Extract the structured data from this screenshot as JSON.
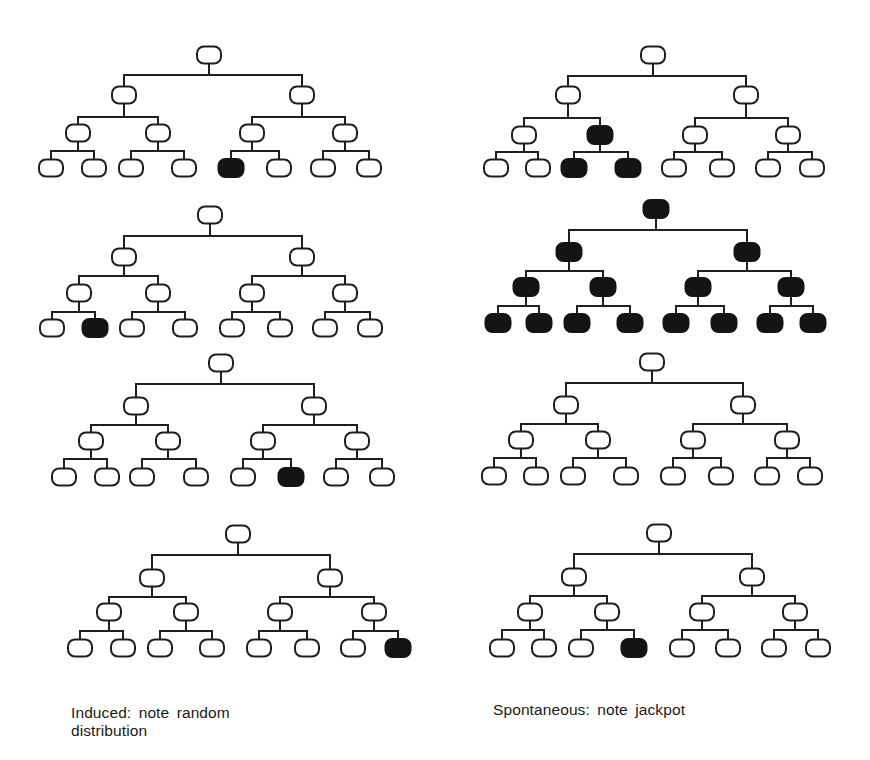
{
  "figure": {
    "colors": {
      "line": "#1e1e1e",
      "node_fill_empty": "#ffffff",
      "node_fill_mutant": "#141414"
    },
    "node": {
      "width": 24,
      "height": 17,
      "rx": 7,
      "stroke": 2
    },
    "captions": {
      "left": "Induced: note random distribution",
      "right": "Spontaneous: note jackpot"
    },
    "columns": [
      {
        "name": "induced",
        "caption_key": "left"
      },
      {
        "name": "spontaneous",
        "caption_key": "right"
      }
    ],
    "trees": [
      {
        "id": "induced-1",
        "column": "induced",
        "root": [
          209,
          55
        ],
        "bar_y": [
          75,
          117,
          151
        ],
        "l1": {
          "x": [
            124,
            302
          ],
          "y": 95
        },
        "l2": {
          "x": [
            78,
            158,
            252,
            345
          ],
          "y": 133
        },
        "leaves": {
          "x": [
            51,
            94,
            131,
            184,
            231,
            279,
            323,
            369
          ],
          "y": 168
        },
        "filled": {
          "root": false,
          "l1": [],
          "l2": [],
          "leaves": [
            4
          ]
        }
      },
      {
        "id": "spontaneous-1",
        "column": "spontaneous",
        "root": [
          653,
          55
        ],
        "bar_y": [
          76,
          118,
          152
        ],
        "l1": {
          "x": [
            568,
            746
          ],
          "y": 95
        },
        "l2": {
          "x": [
            524,
            600,
            695,
            788
          ],
          "y": 135
        },
        "leaves": {
          "x": [
            496,
            538,
            574,
            628,
            674,
            722,
            768,
            812
          ],
          "y": 168
        },
        "filled": {
          "root": false,
          "l1": [],
          "l2": [
            1
          ],
          "leaves": [
            2,
            3
          ]
        }
      },
      {
        "id": "induced-2",
        "column": "induced",
        "root": [
          210,
          215
        ],
        "bar_y": [
          236,
          276,
          312
        ],
        "l1": {
          "x": [
            124,
            302
          ],
          "y": 257
        },
        "l2": {
          "x": [
            79,
            158,
            252,
            345
          ],
          "y": 293
        },
        "leaves": {
          "x": [
            52,
            95,
            132,
            185,
            232,
            280,
            325,
            370
          ],
          "y": 328
        },
        "filled": {
          "root": false,
          "l1": [],
          "l2": [],
          "leaves": [
            1
          ]
        }
      },
      {
        "id": "spontaneous-2",
        "column": "spontaneous",
        "root": [
          656,
          209
        ],
        "bar_y": [
          230,
          271,
          306
        ],
        "l1": {
          "x": [
            569,
            747
          ],
          "y": 252
        },
        "l2": {
          "x": [
            526,
            603,
            698,
            791
          ],
          "y": 287
        },
        "leaves": {
          "x": [
            498,
            539,
            577,
            630,
            676,
            724,
            770,
            813
          ],
          "y": 323
        },
        "filled": {
          "root": true,
          "l1": [
            0,
            1
          ],
          "l2": [
            0,
            1,
            2,
            3
          ],
          "leaves": [
            0,
            1,
            2,
            3,
            4,
            5,
            6,
            7
          ]
        }
      },
      {
        "id": "induced-3",
        "column": "induced",
        "root": [
          221,
          363
        ],
        "bar_y": [
          384,
          425,
          459
        ],
        "l1": {
          "x": [
            136,
            314
          ],
          "y": 406
        },
        "l2": {
          "x": [
            91,
            168,
            263,
            357
          ],
          "y": 441
        },
        "leaves": {
          "x": [
            64,
            107,
            142,
            196,
            243,
            291,
            336,
            382
          ],
          "y": 477
        },
        "filled": {
          "root": false,
          "l1": [],
          "l2": [],
          "leaves": [
            5
          ]
        }
      },
      {
        "id": "spontaneous-3",
        "column": "spontaneous",
        "root": [
          652,
          362
        ],
        "bar_y": [
          383,
          424,
          458
        ],
        "l1": {
          "x": [
            566,
            743
          ],
          "y": 405
        },
        "l2": {
          "x": [
            521,
            598,
            693,
            787
          ],
          "y": 440
        },
        "leaves": {
          "x": [
            494,
            536,
            573,
            626,
            673,
            721,
            767,
            810
          ],
          "y": 476
        },
        "filled": {
          "root": false,
          "l1": [],
          "l2": [],
          "leaves": []
        }
      },
      {
        "id": "induced-4",
        "column": "induced",
        "root": [
          238,
          534
        ],
        "bar_y": [
          555,
          597,
          631
        ],
        "l1": {
          "x": [
            152,
            330
          ],
          "y": 578
        },
        "l2": {
          "x": [
            109,
            186,
            280,
            374
          ],
          "y": 612
        },
        "leaves": {
          "x": [
            80,
            123,
            160,
            212,
            259,
            307,
            353,
            398
          ],
          "y": 648
        },
        "filled": {
          "root": false,
          "l1": [],
          "l2": [],
          "leaves": [
            7
          ]
        }
      },
      {
        "id": "spontaneous-4",
        "column": "spontaneous",
        "root": [
          659,
          533
        ],
        "bar_y": [
          554,
          596,
          630
        ],
        "l1": {
          "x": [
            574,
            752
          ],
          "y": 577
        },
        "l2": {
          "x": [
            530,
            607,
            702,
            795
          ],
          "y": 612
        },
        "leaves": {
          "x": [
            502,
            544,
            581,
            634,
            682,
            728,
            774,
            818
          ],
          "y": 648
        },
        "filled": {
          "root": false,
          "l1": [],
          "l2": [],
          "leaves": [
            3
          ]
        }
      }
    ]
  }
}
